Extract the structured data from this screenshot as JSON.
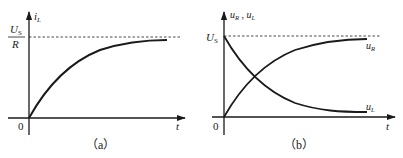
{
  "figure": {
    "panel_a": {
      "caption": "（a）",
      "y_axis_label": {
        "main": "i",
        "sub": "L"
      },
      "x_axis_label": "t",
      "origin_label": "0",
      "asymptote_label": {
        "numerator_main": "U",
        "numerator_sub": "S",
        "denominator": "R"
      },
      "curves": [
        {
          "name": "i_L",
          "shape": "exponential-rise",
          "from": 0,
          "to": "U_S/R"
        }
      ]
    },
    "panel_b": {
      "caption": "（b）",
      "y_axis_label": {
        "a_main": "u",
        "a_sub": "R",
        "sep": " , ",
        "b_main": "u",
        "b_sub": "L"
      },
      "x_axis_label": "t",
      "origin_label": "0",
      "asymptote_label": {
        "main": "U",
        "sub": "S"
      },
      "curves": [
        {
          "name": "u_R",
          "label_main": "u",
          "label_sub": "R",
          "shape": "exponential-rise",
          "from": 0,
          "to": "U_S"
        },
        {
          "name": "u_L",
          "label_main": "u",
          "label_sub": "L",
          "shape": "exponential-decay",
          "from": "U_S",
          "to": 0
        }
      ]
    },
    "colors": {
      "ink": "#1a1a1a",
      "background": "#ffffff"
    }
  }
}
